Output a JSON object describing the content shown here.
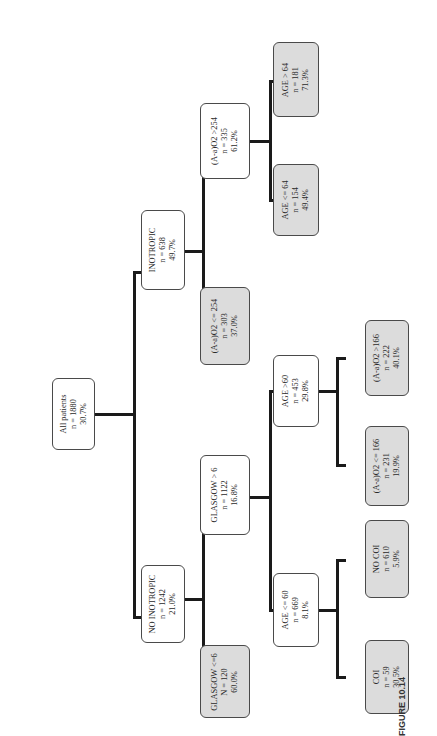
{
  "figure": {
    "caption": "FIGURE 10.14",
    "type": "decision tree (rotated 90°)"
  },
  "nodes": {
    "root": {
      "label": "All patients",
      "n": "n = 1880",
      "pct": "30.7%",
      "leaf": false
    },
    "no_inotropic": {
      "label": "NO INOTROPIC",
      "n": "n = 1242",
      "pct": "21.0%",
      "leaf": false
    },
    "inotropic": {
      "label": "INOTROPIC",
      "n": "n = 638",
      "pct": "49.7%",
      "leaf": false
    },
    "glasgow_le6": {
      "label": "GLASGOW <=6",
      "n": "N = 120",
      "pct": "60.0%",
      "leaf": true
    },
    "glasgow_gt6": {
      "label": "GLASGOW > 6",
      "n": "n = 1122",
      "pct": "16.8%",
      "leaf": false
    },
    "aao2_le254": {
      "label": "(A-a)O2 <= 254",
      "n": "n = 303",
      "pct": "37.0%",
      "leaf": true
    },
    "aao2_gt254": {
      "label": "(A-a)O2 >254",
      "n": "n = 335",
      "pct": "61.2%",
      "leaf": false
    },
    "age_le60": {
      "label": "AGE <= 60",
      "n": "n = 669",
      "pct": "8.1%",
      "leaf": false
    },
    "age_gt60": {
      "label": "AGE >60",
      "n": "n = 453",
      "pct": "29.8%",
      "leaf": false
    },
    "coi": {
      "label": "COI",
      "n": "n = 59",
      "pct": "30.5%",
      "leaf": true
    },
    "no_coi": {
      "label": "NO COI",
      "n": "n = 610",
      "pct": "5.9%",
      "leaf": true
    },
    "aao2_le166": {
      "label": "(A-a)O2 <= 166",
      "n": "n = 231",
      "pct": "19.9%",
      "leaf": true
    },
    "aao2_gt166": {
      "label": "(A-a)O2 >166",
      "n": "n = 222",
      "pct": "40.1%",
      "leaf": true
    },
    "age_le64": {
      "label": "AGE <= 64",
      "n": "n = 154",
      "pct": "49.4%",
      "leaf": true
    },
    "age_gt64": {
      "label": "AGE > 64",
      "n": "n = 181",
      "pct": "71.3%",
      "leaf": true
    }
  },
  "edges": [
    [
      "root",
      "no_inotropic"
    ],
    [
      "root",
      "inotropic"
    ],
    [
      "no_inotropic",
      "glasgow_le6"
    ],
    [
      "no_inotropic",
      "glasgow_gt6"
    ],
    [
      "inotropic",
      "aao2_le254"
    ],
    [
      "inotropic",
      "aao2_gt254"
    ],
    [
      "glasgow_gt6",
      "age_le60"
    ],
    [
      "glasgow_gt6",
      "age_gt60"
    ],
    [
      "age_le60",
      "coi"
    ],
    [
      "age_le60",
      "no_coi"
    ],
    [
      "age_gt60",
      "aao2_le166"
    ],
    [
      "age_gt60",
      "aao2_gt166"
    ],
    [
      "aao2_gt254",
      "age_le64"
    ],
    [
      "aao2_gt254",
      "age_gt64"
    ]
  ],
  "colors": {
    "internal_fill": "#ffffff",
    "leaf_fill": "#dcdcdc",
    "edge": "#1a1a1a",
    "border": "#4a4a4a"
  }
}
